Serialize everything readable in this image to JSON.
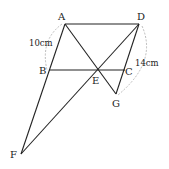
{
  "diagram": {
    "points": {
      "A": {
        "label": "A",
        "x": 65,
        "y": 24
      },
      "D": {
        "label": "D",
        "x": 139,
        "y": 24
      },
      "B": {
        "label": "B",
        "x": 49,
        "y": 70
      },
      "C": {
        "label": "C",
        "x": 125,
        "y": 70
      },
      "E": {
        "label": "E",
        "x": 97,
        "y": 70
      },
      "G": {
        "label": "G",
        "x": 116,
        "y": 94
      },
      "F": {
        "label": "F",
        "x": 21,
        "y": 154
      }
    },
    "segments": [
      [
        "A",
        "D"
      ],
      [
        "A",
        "F"
      ],
      [
        "B",
        "C"
      ],
      [
        "A",
        "G"
      ],
      [
        "D",
        "F"
      ],
      [
        "D",
        "G"
      ]
    ],
    "measurements": {
      "AB": "10cm",
      "DG": "14cm"
    },
    "colors": {
      "line": "#222222",
      "dashed_arc": "#aaaaaa"
    }
  }
}
